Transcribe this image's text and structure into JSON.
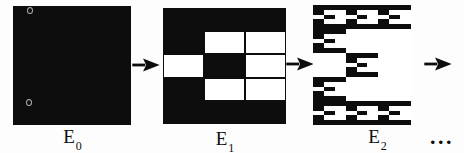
{
  "figure": {
    "stages": [
      {
        "label": "E",
        "sub": "0",
        "depth": 0
      },
      {
        "label": "E",
        "sub": "1",
        "depth": 1
      },
      {
        "label": "E",
        "sub": "2",
        "depth": 2
      }
    ],
    "ellipsis": "...",
    "pattern": {
      "rows": 5,
      "cols": 3,
      "grid_black": [
        [
          1,
          1,
          1
        ],
        [
          1,
          0,
          0
        ],
        [
          0,
          1,
          0
        ],
        [
          1,
          0,
          0
        ],
        [
          1,
          1,
          1
        ]
      ]
    },
    "colors": {
      "ink": "#0d0d0d",
      "paper": "#fdfdfd",
      "removed_cell": "#ffffff"
    }
  }
}
